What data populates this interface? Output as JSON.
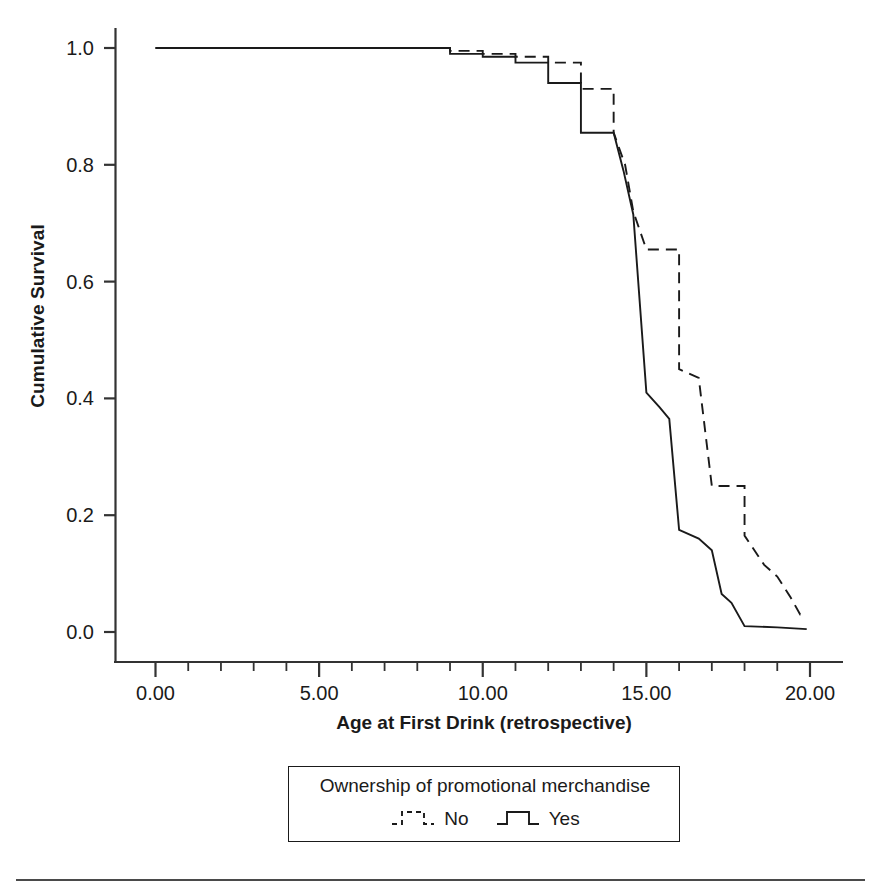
{
  "chart_data": {
    "type": "line",
    "subtype": "kaplan-meier-step",
    "title": "",
    "xlabel": "Age at First Drink (retrospective)",
    "ylabel": "Cumulative Survival",
    "xlim": [
      -0.6,
      20.4
    ],
    "ylim": [
      -0.02,
      1.04
    ],
    "xticks": [
      0,
      5,
      10,
      15,
      20
    ],
    "xtick_labels": [
      "0.00",
      "5.00",
      "10.00",
      "15.00",
      "20.00"
    ],
    "yticks": [
      0.0,
      0.2,
      0.4,
      0.6,
      0.8,
      1.0
    ],
    "ytick_labels": [
      "0.0",
      "0.2",
      "0.4",
      "0.6",
      "0.8",
      "1.0"
    ],
    "minor_xticks": [
      1,
      2,
      3,
      4,
      6,
      7,
      8,
      9,
      11,
      12,
      13,
      14,
      16,
      17,
      18,
      19
    ],
    "grid": false,
    "legend": {
      "position": "below-axes",
      "title": "Ownership of promotional merchandise",
      "entries": [
        {
          "label": "No",
          "style": "dashed",
          "color": "#1a1a1a"
        },
        {
          "label": "Yes",
          "style": "solid",
          "color": "#1a1a1a"
        }
      ]
    },
    "series": [
      {
        "name": "No",
        "label": "No",
        "style": "dashed",
        "color": "#1a1a1a",
        "points": [
          [
            0.0,
            1.0
          ],
          [
            9.0,
            1.0
          ],
          [
            9.0,
            0.995
          ],
          [
            10.0,
            0.995
          ],
          [
            10.0,
            0.99
          ],
          [
            11.0,
            0.99
          ],
          [
            11.0,
            0.985
          ],
          [
            12.0,
            0.985
          ],
          [
            12.0,
            0.975
          ],
          [
            13.0,
            0.975
          ],
          [
            13.0,
            0.93
          ],
          [
            14.0,
            0.93
          ],
          [
            14.0,
            0.855
          ],
          [
            14.35,
            0.8
          ],
          [
            14.6,
            0.72
          ],
          [
            15.0,
            0.655
          ],
          [
            16.0,
            0.655
          ],
          [
            16.0,
            0.45
          ],
          [
            16.6,
            0.435
          ],
          [
            17.0,
            0.25
          ],
          [
            18.0,
            0.25
          ],
          [
            18.0,
            0.165
          ],
          [
            18.6,
            0.115
          ],
          [
            19.0,
            0.095
          ],
          [
            19.4,
            0.06
          ],
          [
            19.7,
            0.03
          ],
          [
            19.9,
            0.03
          ]
        ]
      },
      {
        "name": "Yes",
        "label": "Yes",
        "style": "solid",
        "color": "#1a1a1a",
        "points": [
          [
            0.0,
            1.0
          ],
          [
            9.0,
            1.0
          ],
          [
            9.0,
            0.99
          ],
          [
            10.0,
            0.99
          ],
          [
            10.0,
            0.985
          ],
          [
            11.0,
            0.985
          ],
          [
            11.0,
            0.975
          ],
          [
            12.0,
            0.975
          ],
          [
            12.0,
            0.94
          ],
          [
            13.0,
            0.94
          ],
          [
            13.0,
            0.855
          ],
          [
            14.0,
            0.855
          ],
          [
            14.3,
            0.79
          ],
          [
            14.6,
            0.715
          ],
          [
            15.0,
            0.41
          ],
          [
            15.4,
            0.385
          ],
          [
            15.7,
            0.365
          ],
          [
            16.0,
            0.175
          ],
          [
            16.6,
            0.16
          ],
          [
            17.0,
            0.14
          ],
          [
            17.3,
            0.065
          ],
          [
            17.6,
            0.05
          ],
          [
            18.0,
            0.01
          ],
          [
            19.0,
            0.008
          ],
          [
            19.9,
            0.005
          ]
        ]
      }
    ]
  },
  "axes": {
    "y_title": "Cumulative Survival",
    "x_title": "Age at First Drink (retrospective)"
  },
  "legend": {
    "title": "Ownership of promotional merchandise",
    "no_label": "No",
    "yes_label": "Yes"
  }
}
